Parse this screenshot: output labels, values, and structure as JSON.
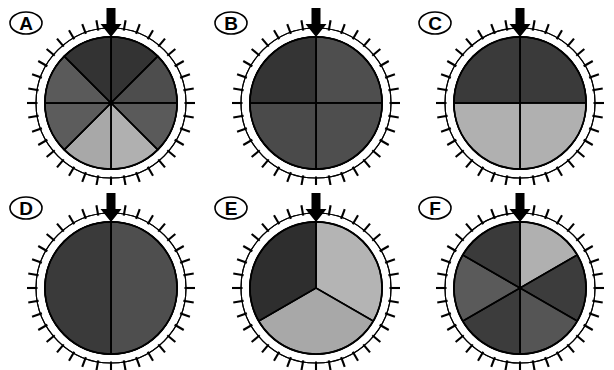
{
  "figure": {
    "title": "",
    "background": "#ffffff",
    "width": 614,
    "height": 370,
    "columns": 3,
    "rows": 2
  },
  "palette": {
    "outline": "#000000",
    "arrow": "#000000",
    "ring_fill": "#ffffff",
    "shade_darkest": "#2e2e2e",
    "shade_dark": "#3a3a3a",
    "shade_medium_dark": "#444444",
    "shade_medium": "#505050",
    "shade_medium_light": "#5c5c5c",
    "shade_light": "#a8a8a8",
    "shade_lightest": "#b4b4b4"
  },
  "common": {
    "tick_count": 36,
    "arrow_label": "load-arrow",
    "arrow_direction": "down",
    "arrow_position_degrees": 0
  },
  "panels": [
    {
      "id": "A",
      "label": "A",
      "sector_count": 8,
      "sector_angle_degrees": 45,
      "start_angle_degrees": 0,
      "center_x": 111,
      "center_y": 103,
      "radius": 66,
      "ring_radius": 75,
      "tick_length": 9,
      "arrow_x": 111,
      "arrow_top": 8,
      "sectors": [
        {
          "index": 0,
          "from_degrees": 0,
          "to_degrees": 45,
          "color": "#333333"
        },
        {
          "index": 1,
          "from_degrees": 45,
          "to_degrees": 90,
          "color": "#4d4d4d"
        },
        {
          "index": 2,
          "from_degrees": 90,
          "to_degrees": 135,
          "color": "#5a5a5a"
        },
        {
          "index": 3,
          "from_degrees": 135,
          "to_degrees": 180,
          "color": "#b0b0b0"
        },
        {
          "index": 4,
          "from_degrees": 180,
          "to_degrees": 225,
          "color": "#a8a8a8"
        },
        {
          "index": 5,
          "from_degrees": 225,
          "to_degrees": 270,
          "color": "#5c5c5c"
        },
        {
          "index": 6,
          "from_degrees": 270,
          "to_degrees": 315,
          "color": "#5a5a5a"
        },
        {
          "index": 7,
          "from_degrees": 315,
          "to_degrees": 360,
          "color": "#333333"
        }
      ]
    },
    {
      "id": "B",
      "label": "B",
      "sector_count": 4,
      "sector_angle_degrees": 90,
      "start_angle_degrees": 0,
      "center_x": 111,
      "center_y": 103,
      "radius": 66,
      "ring_radius": 75,
      "tick_length": 9,
      "arrow_x": 111,
      "arrow_top": 8,
      "sectors": [
        {
          "index": 0,
          "from_degrees": 0,
          "to_degrees": 90,
          "color": "#4e4e4e"
        },
        {
          "index": 1,
          "from_degrees": 90,
          "to_degrees": 180,
          "color": "#4e4e4e"
        },
        {
          "index": 2,
          "from_degrees": 180,
          "to_degrees": 270,
          "color": "#4a4a4a"
        },
        {
          "index": 3,
          "from_degrees": 270,
          "to_degrees": 360,
          "color": "#343434"
        }
      ]
    },
    {
      "id": "C",
      "label": "C",
      "sector_count": 4,
      "sector_angle_degrees": 90,
      "start_angle_degrees": 0,
      "center_x": 111,
      "center_y": 103,
      "radius": 66,
      "ring_radius": 75,
      "tick_length": 9,
      "arrow_x": 111,
      "arrow_top": 8,
      "sectors": [
        {
          "index": 0,
          "from_degrees": 0,
          "to_degrees": 90,
          "color": "#3a3a3a"
        },
        {
          "index": 1,
          "from_degrees": 90,
          "to_degrees": 180,
          "color": "#b0b0b0"
        },
        {
          "index": 2,
          "from_degrees": 180,
          "to_degrees": 270,
          "color": "#b0b0b0"
        },
        {
          "index": 3,
          "from_degrees": 270,
          "to_degrees": 360,
          "color": "#3a3a3a"
        }
      ]
    },
    {
      "id": "D",
      "label": "D",
      "sector_count": 2,
      "sector_angle_degrees": 180,
      "start_angle_degrees": 0,
      "center_x": 111,
      "center_y": 103,
      "radius": 66,
      "ring_radius": 75,
      "tick_length": 9,
      "arrow_x": 111,
      "arrow_top": 8,
      "sectors": [
        {
          "index": 0,
          "from_degrees": 0,
          "to_degrees": 180,
          "color": "#4e4e4e"
        },
        {
          "index": 1,
          "from_degrees": 180,
          "to_degrees": 360,
          "color": "#3a3a3a"
        }
      ]
    },
    {
      "id": "E",
      "label": "E",
      "sector_count": 3,
      "sector_angle_degrees": 120,
      "start_angle_degrees": 0,
      "center_x": 111,
      "center_y": 103,
      "radius": 66,
      "ring_radius": 75,
      "tick_length": 9,
      "arrow_x": 111,
      "arrow_top": 8,
      "sectors": [
        {
          "index": 0,
          "from_degrees": 0,
          "to_degrees": 120,
          "color": "#b4b4b4"
        },
        {
          "index": 1,
          "from_degrees": 120,
          "to_degrees": 240,
          "color": "#a8a8a8"
        },
        {
          "index": 2,
          "from_degrees": 240,
          "to_degrees": 360,
          "color": "#2e2e2e"
        }
      ]
    },
    {
      "id": "F",
      "label": "F",
      "sector_count": 6,
      "sector_angle_degrees": 60,
      "start_angle_degrees": 0,
      "center_x": 111,
      "center_y": 103,
      "radius": 66,
      "ring_radius": 75,
      "tick_length": 9,
      "arrow_x": 111,
      "arrow_top": 8,
      "sectors": [
        {
          "index": 0,
          "from_degrees": 0,
          "to_degrees": 60,
          "color": "#b0b0b0"
        },
        {
          "index": 1,
          "from_degrees": 60,
          "to_degrees": 120,
          "color": "#3c3c3c"
        },
        {
          "index": 2,
          "from_degrees": 120,
          "to_degrees": 180,
          "color": "#555555"
        },
        {
          "index": 3,
          "from_degrees": 180,
          "to_degrees": 240,
          "color": "#3c3c3c"
        },
        {
          "index": 4,
          "from_degrees": 240,
          "to_degrees": 300,
          "color": "#5a5a5a"
        },
        {
          "index": 5,
          "from_degrees": 300,
          "to_degrees": 360,
          "color": "#3a3a3a"
        }
      ]
    }
  ]
}
